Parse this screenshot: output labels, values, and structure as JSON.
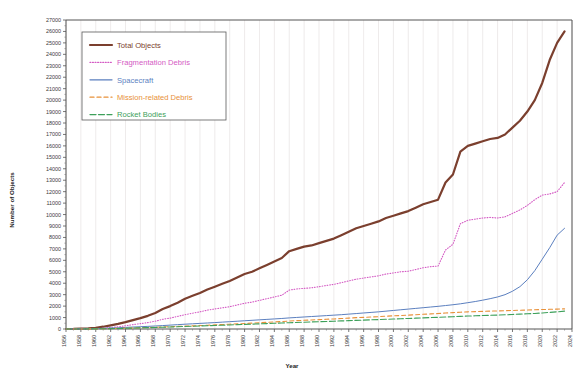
{
  "chart_data": {
    "type": "line",
    "title": "",
    "xlabel": "Year",
    "ylabel": "Number of Objects",
    "xlim": [
      1956,
      2024
    ],
    "ylim": [
      0,
      27000
    ],
    "ytick_step": 1000,
    "xtick_step": 2,
    "grid": true,
    "legend_position": "top-left",
    "ytick_labels": [
      "0",
      "1000",
      "2000",
      "3000",
      "4000",
      "5000",
      "6000",
      "7000",
      "8000",
      "9000",
      "10000",
      "11000",
      "12000",
      "13000",
      "14000",
      "15000",
      "16000",
      "17000",
      "18000",
      "19000",
      "20000",
      "21000",
      "22000",
      "23000",
      "24000",
      "25000",
      "26000",
      "27000"
    ],
    "xtick_labels": [
      "1956",
      "1958",
      "1960",
      "1962",
      "1964",
      "1966",
      "1968",
      "1970",
      "1972",
      "1974",
      "1976",
      "1978",
      "1980",
      "1982",
      "1984",
      "1986",
      "1988",
      "1990",
      "1992",
      "1994",
      "1996",
      "1998",
      "2000",
      "2002",
      "2004",
      "2006",
      "2008",
      "2010",
      "2012",
      "2014",
      "2016",
      "2018",
      "2020",
      "2022",
      "2024"
    ],
    "x": [
      1956,
      1957,
      1958,
      1959,
      1960,
      1961,
      1962,
      1963,
      1964,
      1965,
      1966,
      1967,
      1968,
      1969,
      1970,
      1971,
      1972,
      1973,
      1974,
      1975,
      1976,
      1977,
      1978,
      1979,
      1980,
      1981,
      1982,
      1983,
      1984,
      1985,
      1986,
      1987,
      1988,
      1989,
      1990,
      1991,
      1992,
      1993,
      1994,
      1995,
      1996,
      1997,
      1998,
      1999,
      2000,
      2001,
      2002,
      2003,
      2004,
      2005,
      2006,
      2007,
      2008,
      2009,
      2010,
      2011,
      2012,
      2013,
      2014,
      2015,
      2016,
      2017,
      2018,
      2019,
      2020,
      2021,
      2022,
      2023
    ],
    "series": [
      {
        "name": "Total Objects",
        "color": "#7B3F2E",
        "style": "solid",
        "width": 2.2,
        "values": [
          0,
          5,
          30,
          60,
          110,
          200,
          320,
          450,
          600,
          780,
          950,
          1150,
          1400,
          1750,
          2000,
          2300,
          2650,
          2900,
          3150,
          3450,
          3700,
          3950,
          4200,
          4500,
          4800,
          5000,
          5300,
          5600,
          5900,
          6200,
          6800,
          7000,
          7200,
          7300,
          7500,
          7700,
          7900,
          8200,
          8500,
          8800,
          9000,
          9200,
          9400,
          9700,
          9900,
          10100,
          10300,
          10600,
          10900,
          11100,
          11300,
          12800,
          13500,
          15500,
          16000,
          16200,
          16400,
          16600,
          16700,
          17000,
          17600,
          18200,
          19000,
          20000,
          21500,
          23500,
          25000,
          26000
        ]
      },
      {
        "name": "Fragmentation Debris",
        "color": "#D45BC4",
        "style": "dotted",
        "width": 1.1,
        "values": [
          0,
          0,
          3,
          10,
          25,
          60,
          130,
          200,
          280,
          380,
          470,
          560,
          680,
          850,
          950,
          1100,
          1250,
          1380,
          1500,
          1650,
          1750,
          1850,
          1950,
          2100,
          2250,
          2350,
          2500,
          2650,
          2800,
          2950,
          3400,
          3500,
          3550,
          3600,
          3700,
          3800,
          3900,
          4050,
          4200,
          4350,
          4450,
          4550,
          4650,
          4800,
          4900,
          5000,
          5050,
          5200,
          5350,
          5450,
          5500,
          6900,
          7400,
          9200,
          9500,
          9600,
          9700,
          9750,
          9700,
          9800,
          10100,
          10400,
          10800,
          11300,
          11700,
          11800,
          12000,
          12800
        ]
      },
      {
        "name": "Spacecraft",
        "color": "#5B7FBF",
        "style": "solid",
        "width": 1.0,
        "values": [
          0,
          2,
          10,
          22,
          40,
          60,
          85,
          110,
          140,
          170,
          200,
          230,
          265,
          300,
          340,
          380,
          420,
          455,
          490,
          525,
          560,
          600,
          640,
          680,
          720,
          760,
          800,
          840,
          880,
          920,
          970,
          1010,
          1050,
          1090,
          1130,
          1170,
          1210,
          1250,
          1300,
          1350,
          1400,
          1450,
          1500,
          1560,
          1620,
          1680,
          1740,
          1800,
          1860,
          1920,
          1980,
          2050,
          2120,
          2200,
          2300,
          2400,
          2520,
          2650,
          2800,
          3000,
          3300,
          3700,
          4300,
          5100,
          6100,
          7100,
          8200,
          8800
        ]
      },
      {
        "name": "Mission-related Debris",
        "color": "#E8913A",
        "style": "dashed",
        "width": 1.1,
        "values": [
          0,
          1,
          4,
          8,
          15,
          25,
          40,
          55,
          72,
          90,
          110,
          130,
          150,
          175,
          200,
          225,
          250,
          275,
          300,
          330,
          360,
          390,
          420,
          450,
          480,
          510,
          545,
          580,
          615,
          650,
          700,
          730,
          760,
          790,
          820,
          850,
          880,
          915,
          950,
          990,
          1020,
          1050,
          1080,
          1120,
          1150,
          1180,
          1210,
          1250,
          1290,
          1320,
          1350,
          1400,
          1430,
          1470,
          1500,
          1520,
          1540,
          1560,
          1580,
          1600,
          1620,
          1640,
          1660,
          1680,
          1700,
          1720,
          1740,
          1760
        ]
      },
      {
        "name": "Rocket Bodies",
        "color": "#3DA05A",
        "style": "dashdot",
        "width": 1.1,
        "values": [
          0,
          1,
          3,
          7,
          13,
          22,
          34,
          48,
          64,
          80,
          98,
          116,
          135,
          157,
          178,
          200,
          222,
          244,
          266,
          290,
          312,
          334,
          356,
          380,
          404,
          426,
          450,
          474,
          498,
          522,
          550,
          572,
          594,
          616,
          638,
          660,
          682,
          706,
          730,
          756,
          778,
          800,
          822,
          848,
          872,
          896,
          920,
          946,
          972,
          996,
          1020,
          1050,
          1075,
          1105,
          1130,
          1155,
          1175,
          1195,
          1215,
          1240,
          1270,
          1300,
          1330,
          1360,
          1400,
          1450,
          1500,
          1560
        ]
      }
    ]
  },
  "legend": {
    "items": [
      {
        "label": "Total Objects"
      },
      {
        "label": "Fragmentation Debris"
      },
      {
        "label": "Spacecraft"
      },
      {
        "label": "Mission-related Debris"
      },
      {
        "label": "Rocket Bodies"
      }
    ]
  }
}
